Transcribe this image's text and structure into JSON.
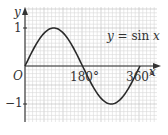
{
  "chart_data": {
    "type": "line",
    "title": "",
    "xlabel": "x",
    "ylabel": "y",
    "legend": "y = sin x",
    "origin_label": "O",
    "x_ticks": [
      "180°",
      "360°"
    ],
    "y_ticks": [
      "1",
      "−1"
    ],
    "xlim": [
      0,
      380
    ],
    "ylim": [
      -1.5,
      1.3
    ],
    "grid": true,
    "series": [
      {
        "name": "y = sin x",
        "x": [
          0,
          30,
          60,
          90,
          120,
          150,
          180,
          210,
          240,
          270,
          300,
          330,
          360
        ],
        "values": [
          0,
          0.5,
          0.866,
          1,
          0.866,
          0.5,
          0,
          -0.5,
          -0.866,
          -1,
          -0.866,
          -0.5,
          0
        ]
      }
    ]
  },
  "labels": {
    "y_axis": "y",
    "x_axis": "x",
    "origin": "O",
    "tick_180": "180°",
    "tick_360": "360°",
    "tick_1": "1",
    "tick_neg1": "−1",
    "equation_y": "y",
    "equation_rest": " = sin",
    "equation_x": " x"
  },
  "colors": {
    "grid_minor": "#d9d9d9",
    "grid_major": "#b8b8b8",
    "axis": "#333333",
    "curve": "#2a2a2a"
  }
}
